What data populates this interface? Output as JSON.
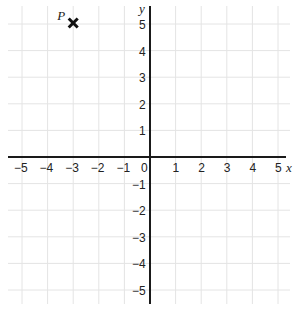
{
  "chart_data": {
    "type": "scatter",
    "title": "",
    "xlabel": "x",
    "ylabel": "y",
    "xlim": [
      -5,
      5
    ],
    "ylim": [
      -5,
      5
    ],
    "grid": true,
    "x_ticks": [
      "−5",
      "−4",
      "−3",
      "−2",
      "−1",
      "0",
      "1",
      "2",
      "3",
      "4",
      "5"
    ],
    "y_ticks": [
      "5",
      "4",
      "3",
      "2",
      "1",
      "−1",
      "−2",
      "−3",
      "−4",
      "−5"
    ],
    "points": [
      {
        "label": "P",
        "x": -3,
        "y": 5,
        "marker": "x"
      }
    ]
  }
}
